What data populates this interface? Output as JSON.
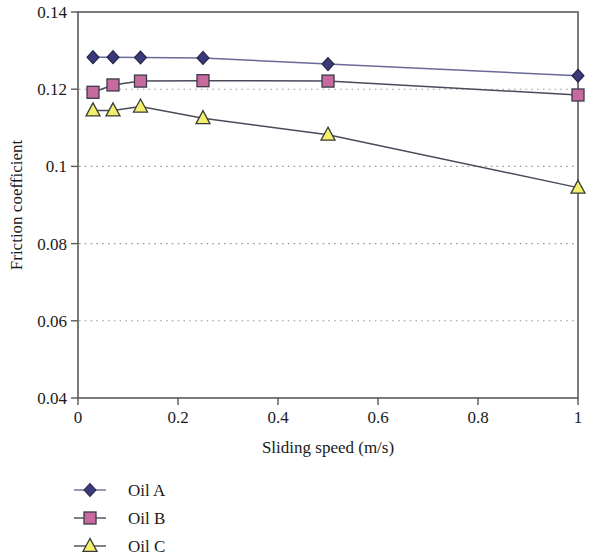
{
  "chart_data": {
    "type": "line",
    "title": "",
    "xlabel": "Sliding speed (m/s)",
    "ylabel": "Friction coefficient",
    "xlim": [
      0,
      1
    ],
    "ylim": [
      0.04,
      0.14
    ],
    "xticks": [
      "0",
      "0.2",
      "0.4",
      "0.6",
      "0.8",
      "1"
    ],
    "xtick_values": [
      0,
      0.2,
      0.4,
      0.6,
      0.8,
      1
    ],
    "yticks": [
      "0.04",
      "0.06",
      "0.08",
      "0.1",
      "0.12",
      "0.14"
    ],
    "ytick_values": [
      0.04,
      0.06,
      0.08,
      0.1,
      0.12,
      0.14
    ],
    "grid": "horizontal-dotted",
    "legend_position": "below-left",
    "x": [
      0.03,
      0.07,
      0.125,
      0.25,
      0.5,
      1.0
    ],
    "series": [
      {
        "name": "Oil A",
        "marker": "diamond",
        "color": "#3a3a7a",
        "edge_color": "#222244",
        "line_color": "#6a6a9a",
        "values": [
          0.1283,
          0.1283,
          0.1282,
          0.1281,
          0.1265,
          0.1235
        ]
      },
      {
        "name": "Oil B",
        "marker": "square",
        "color": "#c96a9e",
        "edge_color": "#3a3a4a",
        "line_color": "#4a4a5a",
        "values": [
          0.1192,
          0.1211,
          0.1221,
          0.1222,
          0.1221,
          0.1185
        ]
      },
      {
        "name": "Oil C",
        "marker": "triangle",
        "color": "#f2f06a",
        "edge_color": "#3a3a3a",
        "line_color": "#4a4a5a",
        "values": [
          0.1145,
          0.1145,
          0.1155,
          0.1125,
          0.1082,
          0.0945
        ]
      }
    ]
  },
  "legend": {
    "items": [
      {
        "label": "Oil A"
      },
      {
        "label": "Oil B"
      },
      {
        "label": "Oil C"
      }
    ]
  },
  "axes": {
    "x_title": "Sliding speed (m/s)",
    "y_title": "Friction coefficient"
  }
}
